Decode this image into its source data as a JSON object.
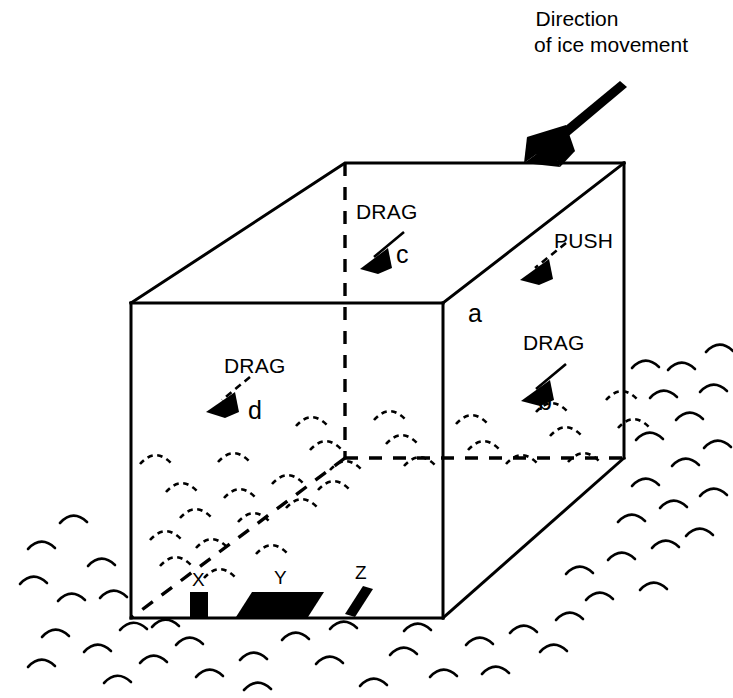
{
  "figure": {
    "title_line_1": "Direction",
    "title_line_2": "of ice movement",
    "background_color": "#ffffff",
    "ink_color": "#000000"
  },
  "annotations": {
    "drag_top": "DRAG",
    "drag_front": "DRAG",
    "drag_right": "DRAG",
    "push_right": "PUSH"
  },
  "face_labels": {
    "a": "a",
    "b": "b",
    "c": "c",
    "d": "d"
  },
  "bed_markers": {
    "x": "X",
    "y": "Y",
    "z": "Z"
  },
  "forces": [
    {
      "key": "a",
      "label": "PUSH",
      "style": "dashed",
      "face": "right-side-upper"
    },
    {
      "key": "b",
      "label": "DRAG",
      "style": "solid",
      "face": "right-side-lower"
    },
    {
      "key": "c",
      "label": "DRAG",
      "style": "solid",
      "face": "top"
    },
    {
      "key": "d",
      "label": "DRAG",
      "style": "dashed",
      "face": "front"
    }
  ],
  "box": {
    "front_top_left": [
      131,
      303
    ],
    "front_top_right": [
      443,
      303
    ],
    "front_bottom_left": [
      131,
      618
    ],
    "front_bottom_right": [
      443,
      618
    ],
    "back_top_left": [
      345,
      163
    ],
    "back_top_right": [
      624,
      163
    ],
    "back_bottom_left": [
      345,
      458
    ],
    "back_bottom_right": [
      624,
      458
    ]
  }
}
